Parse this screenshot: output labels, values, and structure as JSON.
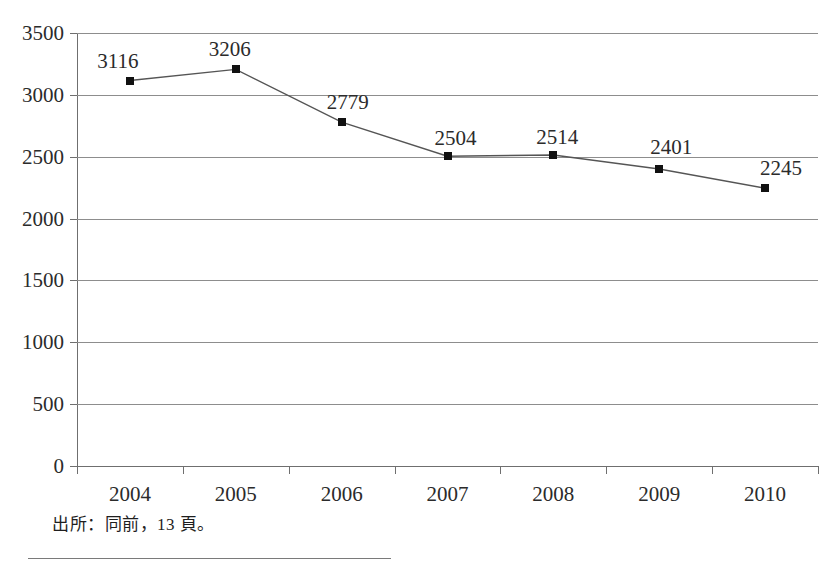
{
  "figure": {
    "clipped_title": "",
    "caption": "出所：同前，13 頁。"
  },
  "chart_data": {
    "type": "line",
    "title": "",
    "subtitle": "",
    "xlabel": "",
    "ylabel": "",
    "categories": [
      "2004",
      "2005",
      "2006",
      "2007",
      "2008",
      "2009",
      "2010"
    ],
    "values": [
      3116,
      3206,
      2779,
      2504,
      2514,
      2401,
      2245
    ],
    "point_labels": [
      "3116",
      "3206",
      "2779",
      "2504",
      "2514",
      "2401",
      "2245"
    ],
    "series": [
      {
        "name": "",
        "values": [
          3116,
          3206,
          2779,
          2504,
          2514,
          2401,
          2245
        ],
        "marker": "square",
        "marker_color": "#111111",
        "line_color": "#555555"
      }
    ],
    "ylim": [
      0,
      3500
    ],
    "yticks": [
      0,
      500,
      1000,
      1500,
      2000,
      2500,
      3000,
      3500
    ],
    "ytick_labels": [
      "0",
      "500",
      "1000",
      "1500",
      "2000",
      "2500",
      "3000",
      "3500"
    ],
    "grid": true,
    "grid_axis": "y",
    "grid_color": "#8d8d8d",
    "legend": false,
    "legend_position": "none",
    "data_labels": true
  }
}
